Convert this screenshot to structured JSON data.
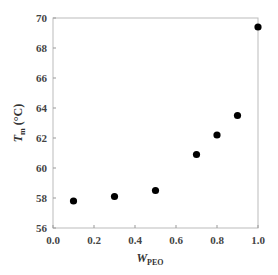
{
  "chart_data": {
    "type": "scatter",
    "title": "",
    "xlabel": "W_PEO",
    "ylabel": "T_m (°C)",
    "x": [
      0.1,
      0.3,
      0.5,
      0.7,
      0.8,
      0.9,
      1.0
    ],
    "series": [
      {
        "name": "Tm",
        "values": [
          57.8,
          58.1,
          58.5,
          60.9,
          62.2,
          63.5,
          69.4
        ]
      }
    ],
    "xlim": [
      0.0,
      1.0
    ],
    "ylim": [
      56,
      70
    ],
    "xticks": [
      "0.0",
      "0.2",
      "0.4",
      "0.6",
      "0.8",
      "1.0"
    ],
    "yticks": [
      "56",
      "58",
      "60",
      "62",
      "64",
      "66",
      "68",
      "70"
    ],
    "grid": false,
    "legend": null,
    "marker_color": "#000000"
  },
  "labels": {
    "x_main": "W",
    "x_sub": "PEO",
    "y_main": "T",
    "y_sub": "m",
    "y_unit": "(°C)"
  }
}
